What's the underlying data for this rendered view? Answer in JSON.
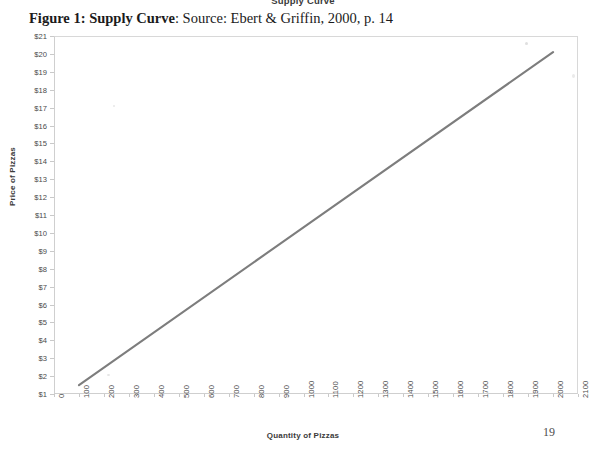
{
  "chart_header": "Supply Curve",
  "caption": {
    "strong": "Figure 1: Supply Curve",
    "rest": ": Source: Ebert & Griffin, 2000, p. 14"
  },
  "page_number_artifact": "19",
  "colors": {
    "line": "#7d7d7d",
    "frame": "#cfcfcf",
    "tick_text": "#4a4a4a",
    "axis_title": "#3a3a3a",
    "caption_text": "#1b1b1b"
  },
  "chart_data": {
    "type": "line",
    "title": "Supply Curve",
    "xlabel": "Quantity of Pizzas",
    "ylabel": "Price of Pizzas",
    "xlim": [
      0,
      2100
    ],
    "ylim": [
      1,
      21
    ],
    "grid": false,
    "legend": "none",
    "x_tick_labels": [
      "0",
      "100",
      "200",
      "300",
      "400",
      "500",
      "600",
      "700",
      "800",
      "900",
      "1000",
      "1100",
      "1200",
      "1300",
      "1400",
      "1500",
      "1600",
      "1700",
      "1800",
      "1900",
      "2000",
      "2100"
    ],
    "x_ticks": [
      0,
      100,
      200,
      300,
      400,
      500,
      600,
      700,
      800,
      900,
      1000,
      1100,
      1200,
      1300,
      1400,
      1500,
      1600,
      1700,
      1800,
      1900,
      2000,
      2100
    ],
    "y_tick_labels": [
      "$1",
      "$2",
      "$3",
      "$4",
      "$5",
      "$6",
      "$7",
      "$8",
      "$9",
      "$10",
      "$11",
      "$12",
      "$13",
      "$14",
      "$15",
      "$16",
      "$17",
      "$18",
      "$19",
      "$20",
      "$21"
    ],
    "y_ticks": [
      1,
      2,
      3,
      4,
      5,
      6,
      7,
      8,
      9,
      10,
      11,
      12,
      13,
      14,
      15,
      16,
      17,
      18,
      19,
      20,
      21
    ],
    "series": [
      {
        "name": "Supply",
        "x": [
          100,
          2000
        ],
        "y": [
          1.5,
          20.1
        ]
      }
    ]
  }
}
